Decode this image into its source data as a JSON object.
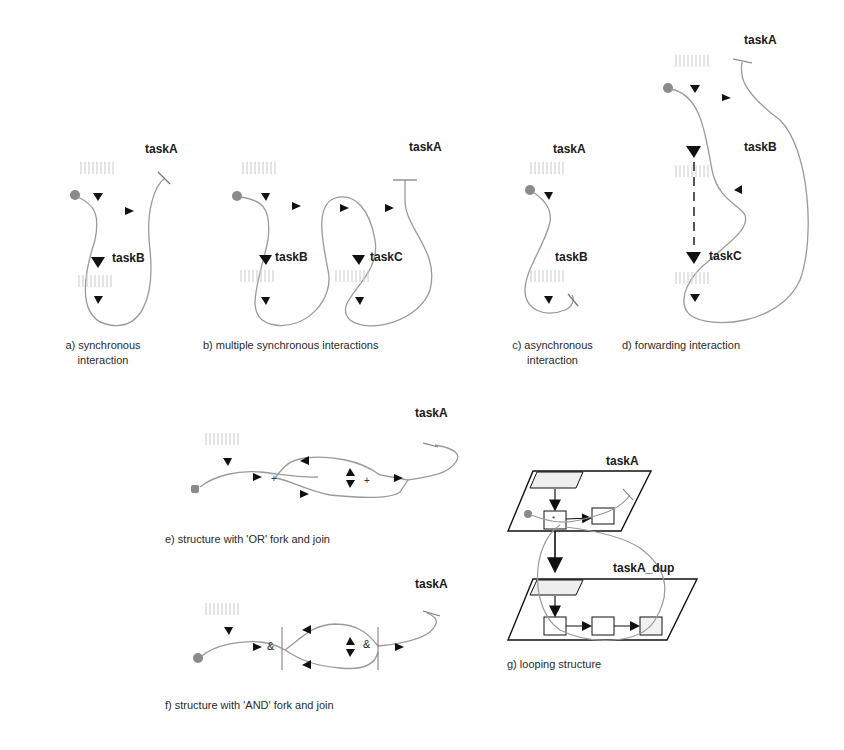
{
  "panels": [
    {
      "id": "a",
      "caption_line1": "a) synchronous",
      "caption_line2": "interaction",
      "tasks": [
        "taskA",
        "taskB"
      ]
    },
    {
      "id": "b",
      "caption": "b) multiple synchronous interactions",
      "tasks": [
        "taskA",
        "taskB",
        "taskC"
      ]
    },
    {
      "id": "c",
      "caption_line1": "c) asynchronous",
      "caption_line2": "interaction",
      "tasks": [
        "taskA",
        "taskB"
      ]
    },
    {
      "id": "d",
      "caption": "d) forwarding interaction",
      "tasks": [
        "taskA",
        "taskB",
        "taskC"
      ]
    },
    {
      "id": "e",
      "caption": "e) structure with 'OR' fork and join",
      "tasks": [
        "taskA"
      ],
      "fork_symbol": "+",
      "join_symbol": "+"
    },
    {
      "id": "f",
      "caption": "f) structure with 'AND' fork and join",
      "tasks": [
        "taskA"
      ],
      "fork_symbol": "&",
      "join_symbol": "&"
    },
    {
      "id": "g",
      "caption": "g) looping structure",
      "tasks": [
        "taskA",
        "taskA_dup"
      ],
      "loop_symbol": "*"
    }
  ],
  "colors": {
    "path": "#9a9a9a",
    "arrow": "#111111",
    "start_dot": "#8a8a8a",
    "text": "#1a1a1a"
  }
}
